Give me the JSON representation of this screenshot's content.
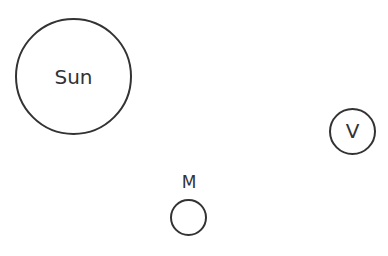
{
  "diagram": {
    "bodies": [
      {
        "id": "sun",
        "label": "Sun",
        "center": [
          73,
          76
        ],
        "radius": 58
      },
      {
        "id": "venus",
        "label": "V",
        "center": [
          352,
          131
        ],
        "radius": 23
      },
      {
        "id": "mercury",
        "label": "M",
        "center": [
          188,
          217
        ],
        "radius": 18,
        "label_position": "above"
      }
    ],
    "stroke_color": "#333333",
    "background": "#ffffff"
  }
}
